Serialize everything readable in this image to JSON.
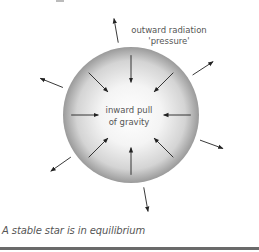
{
  "diagram": {
    "labels": {
      "outward_line1": "outward radiation",
      "outward_line2": "'pressure'",
      "inward_line1": "inward pull",
      "inward_line2": "of gravity"
    },
    "caption": "A stable star is in equilibrium",
    "inward_arrows": [
      {
        "name": "inward-arrow-top",
        "angle_deg": 90
      },
      {
        "name": "inward-arrow-top-left",
        "angle_deg": 135
      },
      {
        "name": "inward-arrow-left",
        "angle_deg": 180
      },
      {
        "name": "inward-arrow-bottom-left",
        "angle_deg": 225
      },
      {
        "name": "inward-arrow-bottom",
        "angle_deg": 270
      },
      {
        "name": "inward-arrow-bottom-right",
        "angle_deg": 315
      },
      {
        "name": "inward-arrow-right",
        "angle_deg": 0
      },
      {
        "name": "inward-arrow-top-right",
        "angle_deg": 45
      }
    ],
    "outward_arrows": [
      {
        "name": "outward-arrow-top",
        "angle_deg": 100
      },
      {
        "name": "outward-arrow-top-right",
        "angle_deg": 33
      },
      {
        "name": "outward-arrow-right",
        "angle_deg": -20
      },
      {
        "name": "outward-arrow-bottom",
        "angle_deg": -80
      },
      {
        "name": "outward-arrow-bottom-left",
        "angle_deg": -145
      },
      {
        "name": "outward-arrow-left",
        "angle_deg": 158
      }
    ],
    "colors": {
      "sphere_light": "#ffffff",
      "sphere_dark": "#9a9a9a",
      "arrow": "#222222",
      "text": "#555555"
    }
  }
}
